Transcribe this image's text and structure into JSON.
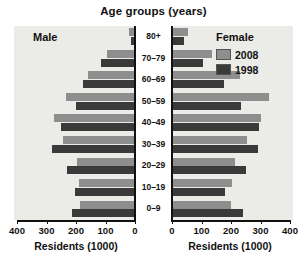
{
  "chart_data": {
    "type": "bar",
    "subtype": "population-pyramid",
    "title": "Age groups (years)",
    "categories": [
      "80+",
      "70–79",
      "60–69",
      "50–59",
      "40–49",
      "30–39",
      "20–29",
      "10–19",
      "0–9"
    ],
    "xlabel": "Residents (1000)",
    "ylabel": "Age groups (years)",
    "xlim": [
      0,
      400
    ],
    "grid": false,
    "legend_position": "top-right",
    "panels": [
      {
        "name": "Male",
        "direction": "left",
        "tick_values": [
          400,
          300,
          200,
          100,
          0
        ],
        "axis_title": "Residents (1000)",
        "series": [
          {
            "name": "2008",
            "color": "#8e8e8e",
            "values": [
              20,
              95,
              160,
              235,
              275,
              245,
              195,
              190,
              185
            ]
          },
          {
            "name": "1998",
            "color": "#3a3a3a",
            "values": [
              12,
              115,
              175,
              200,
              250,
              280,
              230,
              205,
              215
            ]
          }
        ]
      },
      {
        "name": "Female",
        "direction": "right",
        "tick_values": [
          0,
          100,
          200,
          300,
          400
        ],
        "axis_title": "Residents (1000)",
        "series": [
          {
            "name": "2008",
            "color": "#8e8e8e",
            "values": [
              55,
              135,
              230,
              330,
              300,
              255,
              215,
              205,
              200
            ]
          },
          {
            "name": "1998",
            "color": "#3a3a3a",
            "values": [
              40,
              105,
              175,
              235,
              295,
              290,
              250,
              180,
              240
            ]
          }
        ]
      }
    ],
    "legend": [
      {
        "label": "2008",
        "color": "#8e8e8e"
      },
      {
        "label": "1998",
        "color": "#3a3a3a"
      }
    ]
  },
  "headings": {
    "male": "Male",
    "female": "Female"
  },
  "legend_title": "Female",
  "colors": {
    "series_2008": "#8e8e8e",
    "series_1998": "#3a3a3a",
    "plot_background": "#ebebe8",
    "axis": "#111111"
  }
}
